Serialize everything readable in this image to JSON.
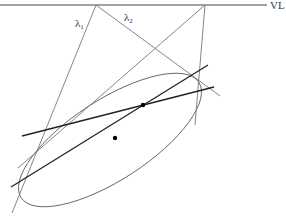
{
  "diagram": {
    "title": "",
    "labels": {
      "vanishing_line": "VL",
      "lambda1": "λ",
      "lambda1_sub": "1",
      "lambda2": "λ",
      "lambda2_sub": "2"
    },
    "colors": {
      "thin_line": "#777777",
      "dark_line": "#222222",
      "ellipse": "#666666",
      "point": "#000000",
      "label": "#333333"
    },
    "elements": {
      "vanishing_line": {
        "from": [
          0,
          5
        ],
        "to": [
          267,
          5
        ]
      },
      "vertex_left": [
        96,
        5
      ],
      "vertex_right": [
        205,
        5
      ],
      "lambda1_line": {
        "from": [
          96,
          5
        ],
        "to": [
          12,
          213
        ]
      },
      "lambda2_line": {
        "from": [
          96,
          5
        ],
        "to": [
          220,
          96
        ]
      },
      "right_tangent_line_a": {
        "from": [
          205,
          5
        ],
        "to": [
          18,
          168
        ]
      },
      "right_tangent_line_b": {
        "from": [
          205,
          5
        ],
        "to": [
          195,
          125
        ]
      },
      "polar_line_a": {
        "from": [
          11,
          187
        ],
        "to": [
          208,
          65
        ]
      },
      "polar_line_b": {
        "from": [
          22,
          136
        ],
        "to": [
          214,
          87
        ]
      },
      "pole_point": [
        143,
        105
      ],
      "center_point": [
        115,
        138
      ],
      "ellipse": {
        "cx": 110,
        "cy": 140,
        "rx": 106,
        "ry": 40,
        "rotation": -33
      }
    }
  }
}
